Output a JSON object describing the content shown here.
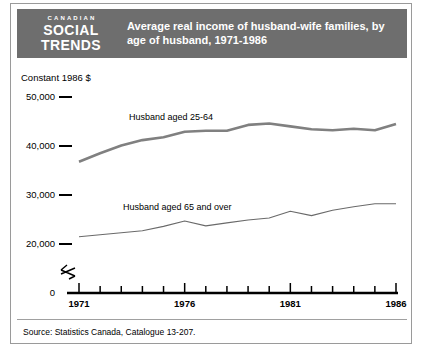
{
  "header": {
    "logo_top": "CANADIAN",
    "logo_mid": "SOCIAL",
    "logo_bot": "TRENDS",
    "title": "Average real income of husband-wife families, by age of husband, 1971-1986",
    "band_color": "#6e6e6e",
    "text_color": "#ffffff"
  },
  "source": {
    "text": "Source:   Statistics Canada, Catalogue 13-207."
  },
  "chart_data": {
    "type": "line",
    "title": "Average real income of husband-wife families, by age of husband, 1971-1986",
    "xlabel": "",
    "ylabel": "Constant 1986 $",
    "axis_caption": "Constant 1986 $",
    "grid": false,
    "legend_position": "inline-annotation",
    "axis_break": true,
    "axis_break_symbol": "zigzag",
    "ylim": [
      0,
      52000
    ],
    "yticks": [
      0,
      20000,
      30000,
      40000,
      50000
    ],
    "ytick_labels": [
      "0",
      "20,000",
      "30,000",
      "40,000",
      "50,000"
    ],
    "xlim": [
      1971,
      1986
    ],
    "xticks": [
      1971,
      1972,
      1973,
      1974,
      1975,
      1976,
      1977,
      1978,
      1979,
      1980,
      1981,
      1982,
      1983,
      1984,
      1985,
      1986
    ],
    "xtick_labels": [
      "1971",
      "1976",
      "1981",
      "1986"
    ],
    "xtick_labelled_years": [
      1971,
      1976,
      1981,
      1986
    ],
    "x": [
      1971,
      1972,
      1973,
      1974,
      1975,
      1976,
      1977,
      1978,
      1979,
      1980,
      1981,
      1982,
      1983,
      1984,
      1985,
      1986
    ],
    "series": [
      {
        "name": "Husband aged 25-64",
        "label": "Husband  aged  25-64",
        "color": "#808080",
        "width": 2.6,
        "values": [
          36800,
          38500,
          40100,
          41200,
          41800,
          42900,
          43100,
          43100,
          44300,
          44600,
          44000,
          43400,
          43200,
          43500,
          43200,
          44500
        ]
      },
      {
        "name": "Husband aged 65 and over",
        "label": "Husband aged 65 and over",
        "color": "#6a6a6a",
        "width": 1.1,
        "values": [
          21500,
          21900,
          22300,
          22700,
          23600,
          24700,
          23700,
          24300,
          24900,
          25300,
          26700,
          25800,
          26900,
          27600,
          28200,
          28200
        ]
      }
    ]
  }
}
